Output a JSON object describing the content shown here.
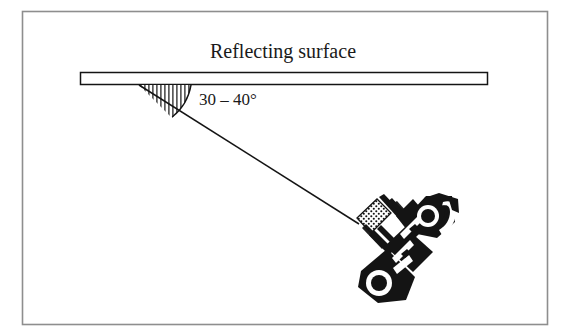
{
  "figure": {
    "kind": "line-diagram",
    "background_color": "#ffffff",
    "ink_color": "#141414",
    "border": {
      "name": "figure-border",
      "visible": true,
      "color": "#8e8e8e",
      "x": 22,
      "y": 11,
      "width": 526,
      "height": 314
    },
    "title": {
      "text": "Reflecting surface",
      "center_x": 283,
      "baseline_y": 58
    },
    "angle_annotation": {
      "text": "30 – 40°",
      "value_min": 30,
      "value_max": 40,
      "unit": "degrees",
      "x": 199,
      "baseline_y": 105
    },
    "reflecting_surface": {
      "name": "reflecting-surface-bar",
      "x": 80,
      "y": 72,
      "width": 408,
      "height": 13,
      "fill": "#ffffff",
      "stroke": "#141414"
    },
    "incidence_ray": {
      "name": "incidence-ray-line",
      "x1": 139,
      "y1": 85,
      "x2": 359,
      "y2": 224,
      "stroke": "#141414"
    },
    "angle_wedge": {
      "name": "angle-wedge-hatched",
      "vertex_x": 139,
      "vertex_y": 85,
      "arc_radius": 52,
      "hatch": "vertical",
      "hatch_line_count": 14
    },
    "petroglyph": {
      "name": "stylized-bird-petroglyph",
      "style": "northwest-coast-formline",
      "bounds": {
        "x": 348,
        "y": 193,
        "width": 114,
        "height": 122
      },
      "fill": "#141414"
    }
  }
}
